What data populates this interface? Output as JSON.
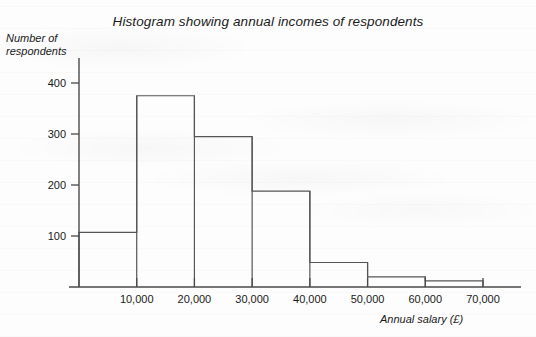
{
  "chart_data": {
    "type": "bar",
    "title": "Histogram showing annual incomes of respondents",
    "xlabel": "Annual salary (£)",
    "ylabel": "Number of respondents",
    "ylabel_line1": "Number of",
    "ylabel_line2": "respondents",
    "grid": false,
    "legend": null,
    "xlim": [
      0,
      70000
    ],
    "ylim": [
      0,
      430
    ],
    "bin_width": 10000,
    "bin_edges": [
      0,
      10000,
      20000,
      30000,
      40000,
      50000,
      60000,
      70000
    ],
    "categories": [
      "0–10,000",
      "10,000–20,000",
      "20,000–30,000",
      "30,000–40,000",
      "40,000–50,000",
      "50,000–60,000",
      "60,000–70,000"
    ],
    "values": [
      107,
      375,
      295,
      188,
      48,
      20,
      12
    ],
    "xticks": [
      {
        "value": 10000,
        "label": "10,000"
      },
      {
        "value": 20000,
        "label": "20,000"
      },
      {
        "value": 30000,
        "label": "30,000"
      },
      {
        "value": 40000,
        "label": "40,000"
      },
      {
        "value": 50000,
        "label": "50,000"
      },
      {
        "value": 60000,
        "label": "60,000"
      },
      {
        "value": 70000,
        "label": "70,000"
      }
    ],
    "yticks": [
      {
        "value": 100,
        "label": "100"
      },
      {
        "value": 200,
        "label": "200"
      },
      {
        "value": 300,
        "label": "300"
      },
      {
        "value": 400,
        "label": "400"
      }
    ],
    "colors": {
      "bar_stroke": "#555555",
      "bar_fill": "none",
      "axis": "#4a4a4a",
      "text": "#1a1a1a",
      "background": "#fdfdfd"
    }
  }
}
